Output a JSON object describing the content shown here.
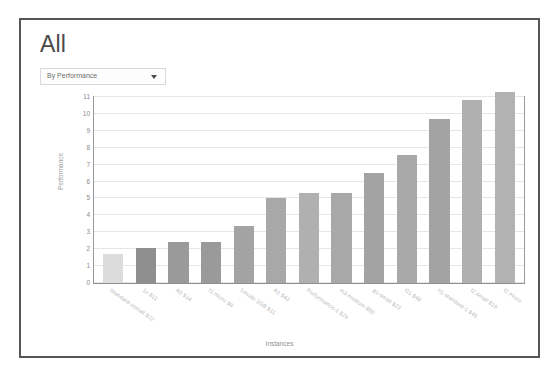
{
  "window": {
    "border_color": "#55565a",
    "background": "#ffffff"
  },
  "header": {
    "title": "All"
  },
  "filter": {
    "selected": "By Performance",
    "arrow_icon": "chevron-down-icon",
    "options": [
      "By Performance"
    ]
  },
  "chart_data": {
    "type": "bar",
    "title": "All",
    "xlabel": "Instances",
    "ylabel": "Performance",
    "ylim": [
      0,
      11
    ],
    "yticks": [
      0,
      1,
      2,
      3,
      4,
      5,
      6,
      7,
      8,
      9,
      10,
      11
    ],
    "grid": true,
    "legend": "none",
    "categories": [
      "Standard-xsmall $22",
      "1x $11",
      "A0 $14",
      "t1.micro $9",
      "Linode 1GB $11",
      "A1 $43",
      "Performance-1 $29",
      "m3.medium $50",
      "g1-small $23",
      "G1 $48",
      "n1-standard-1 $46",
      "t2.small $19",
      "t2.micro"
    ],
    "values": [
      1.7,
      2.1,
      2.4,
      2.45,
      3.4,
      5.0,
      5.3,
      5.35,
      6.5,
      7.6,
      9.7,
      10.8,
      11.3
    ],
    "bar_colors": [
      "#dcdcdc",
      "#8f8f8f",
      "#9a9a9a",
      "#9a9a9a",
      "#a3a3a3",
      "#a8a8a8",
      "#b0b0b0",
      "#a8a8a8",
      "#a3a3a3",
      "#a8a8a8",
      "#a3a3a3",
      "#b0b0b0",
      "#b3b3b3"
    ]
  }
}
